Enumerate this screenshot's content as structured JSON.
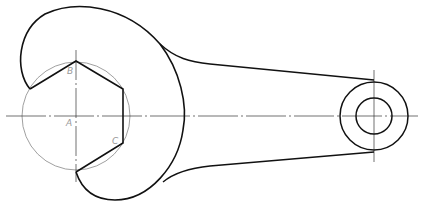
{
  "drawing": {
    "subject": "open-end wrench with ring end",
    "labels": [
      {
        "id": "A",
        "text": "A",
        "x": 66,
        "y": 118
      },
      {
        "id": "B",
        "text": "B",
        "x": 67,
        "y": 66
      },
      {
        "id": "C",
        "text": "C",
        "x": 112,
        "y": 136
      }
    ],
    "colors": {
      "outline": "#111111",
      "construction": "#888888",
      "centerline": "#333333"
    }
  }
}
